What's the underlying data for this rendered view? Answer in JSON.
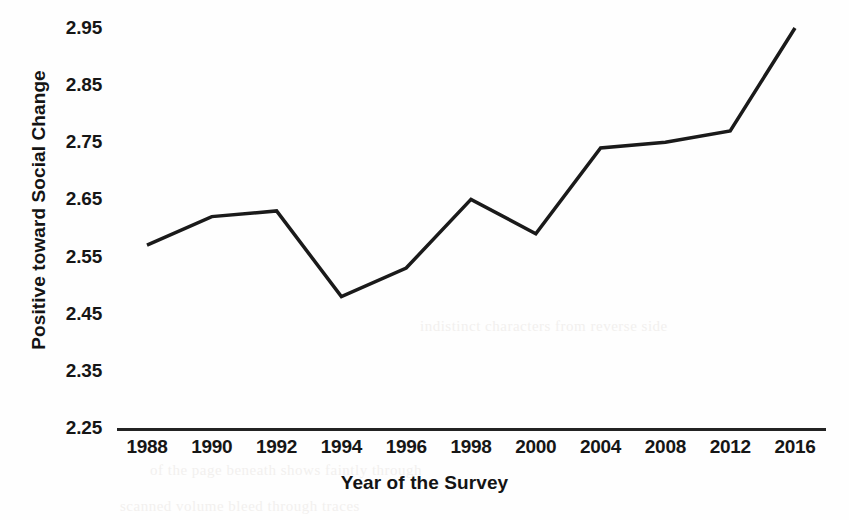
{
  "chart_data": {
    "type": "line",
    "title": "",
    "xlabel": "Year of the Survey",
    "ylabel": "Positive toward Social Change",
    "categories": [
      "1988",
      "1990",
      "1992",
      "1994",
      "1996",
      "1998",
      "2000",
      "2004",
      "2008",
      "2012",
      "2016"
    ],
    "values": [
      2.57,
      2.62,
      2.63,
      2.48,
      2.53,
      2.65,
      2.59,
      2.74,
      2.75,
      2.77,
      2.95
    ],
    "series": [
      {
        "name": "Positive toward Social Change",
        "values": [
          2.57,
          2.62,
          2.63,
          2.48,
          2.53,
          2.65,
          2.59,
          2.74,
          2.75,
          2.77,
          2.95
        ]
      }
    ],
    "ylim": [
      2.25,
      2.95
    ],
    "ytick_labels": [
      "2.95",
      "2.85",
      "2.75",
      "2.65",
      "2.55",
      "2.45",
      "2.35",
      "2.25"
    ],
    "ytick_values": [
      2.95,
      2.85,
      2.75,
      2.65,
      2.55,
      2.45,
      2.35,
      2.25
    ],
    "ytick_step": 0.1,
    "grid": false,
    "legend": false,
    "legend_position": "none",
    "markers": false,
    "line_color": "#1a1a1a",
    "line_width": 3.5,
    "background_color": "#fefefe",
    "annotations": []
  },
  "ghost_text": [
    "of the page beneath shows faintly through",
    "scanned volume bleed through traces",
    "indistinct characters from reverse side"
  ]
}
